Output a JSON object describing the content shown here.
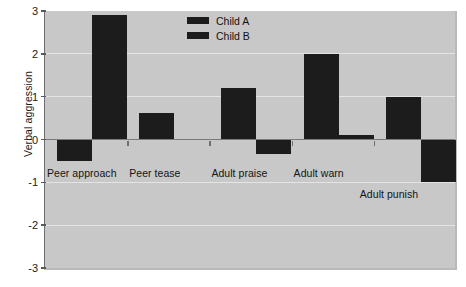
{
  "chart_data": {
    "type": "bar",
    "title": "",
    "xlabel": "",
    "ylabel": "Verbal aggression",
    "categories": [
      "Peer approach",
      "Peer tease",
      "Adult praise",
      "Adult warn",
      "Adult punish"
    ],
    "series": [
      {
        "name": "Child A",
        "color": "#1c1c1c",
        "values": [
          -0.5,
          0.63,
          1.2,
          2.0,
          1.0
        ]
      },
      {
        "name": "Child B",
        "color": "#1c1c1c",
        "values": [
          2.9,
          0,
          -0.35,
          0.1,
          -1.0
        ]
      }
    ],
    "ylim": [
      -3,
      3
    ],
    "yticks": [
      3,
      2,
      1,
      0,
      -1,
      -2,
      -3
    ],
    "ytick_labels": [
      "3",
      "2",
      "1",
      "0",
      "-1",
      "-2",
      "-3"
    ],
    "grid": true,
    "legend_position": "top-center",
    "plot_background": "#c8c8c8",
    "grid_color": "#e4e4e4",
    "axis_color": "#6e6e6e"
  },
  "axis": {
    "y_title": "Verbal aggression",
    "tick_labels": [
      "3",
      "2",
      "1",
      "0",
      "-1",
      "-2",
      "-3"
    ]
  },
  "legend": {
    "entries": [
      {
        "label": "Child A"
      },
      {
        "label": "Child B"
      }
    ]
  },
  "categories": [
    {
      "label": "Peer approach"
    },
    {
      "label": "Peer tease"
    },
    {
      "label": "Adult praise"
    },
    {
      "label": "Adult warn"
    },
    {
      "label": "Adult punish"
    }
  ]
}
